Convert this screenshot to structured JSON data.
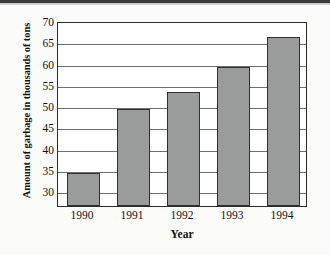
{
  "chart_data": {
    "type": "bar",
    "title": "",
    "xlabel": "Year",
    "ylabel": "Amount of garbage in thousands of tons",
    "categories": [
      "1990",
      "1991",
      "1992",
      "1993",
      "1994"
    ],
    "values": [
      34.2,
      49.2,
      53.2,
      59.3,
      66.3
    ],
    "ylim": [
      26.5,
      70
    ],
    "ytick_labels": [
      "30",
      "35",
      "40",
      "45",
      "50",
      "55",
      "60",
      "65",
      "70"
    ],
    "ytick_values": [
      30,
      35,
      40,
      45,
      50,
      55,
      60,
      65,
      70
    ],
    "grid": true,
    "legend": false,
    "bar_color": "#9a9b9b",
    "bar_border_color": "#2f2f2f",
    "axis_color": "#2c2c2c",
    "gridline_color": "#6f6f6f",
    "background": "#fbfbfa"
  }
}
